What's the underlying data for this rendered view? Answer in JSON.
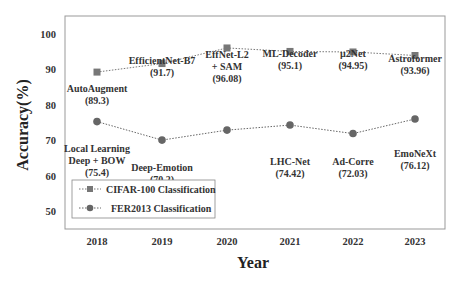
{
  "chart_data": {
    "type": "line",
    "title": "",
    "xlabel": "Year",
    "ylabel": "Accuracy(%)",
    "x": [
      "2018",
      "2019",
      "2020",
      "2021",
      "2022",
      "2023"
    ],
    "ylim": [
      45,
      105
    ],
    "yticks": [
      50,
      60,
      70,
      80,
      90,
      100
    ],
    "grid": false,
    "legend_position": "lower left (inside)",
    "series": [
      {
        "name": "CIFAR-100 Classification",
        "marker": "square",
        "color": "#777777",
        "linestyle": "dotted",
        "values": [
          89.3,
          91.7,
          96.08,
          95.1,
          94.95,
          93.96
        ],
        "labels": [
          "AutoAugment",
          "EfficientNet-B7",
          "EffNet-L2 + SAM",
          "ML-Decoder",
          "µ2Net",
          "Astroformer"
        ]
      },
      {
        "name": "FER2013 Classification",
        "marker": "circle",
        "color": "#666666",
        "linestyle": "dotted",
        "values": [
          75.4,
          70.2,
          null,
          74.42,
          72.03,
          76.12
        ],
        "labels": [
          "Local Learning Deep + BOW",
          "Deep-Emotion",
          "",
          "LHC-Net",
          "Ad-Corre",
          "EmoNeXt"
        ]
      }
    ]
  },
  "annotations": {
    "cifar": [
      {
        "lines": [
          "AutoAugment",
          "(89.3)"
        ]
      },
      {
        "lines": [
          "EfficientNet-B7",
          "(91.7)"
        ]
      },
      {
        "lines": [
          "EffNet-L2",
          "+ SAM",
          "(96.08)"
        ]
      },
      {
        "lines": [
          "ML-Decoder",
          "(95.1)"
        ]
      },
      {
        "lines": [
          "µ2Net",
          "(94.95)"
        ]
      },
      {
        "lines": [
          "Astroformer",
          "(93.96)"
        ]
      }
    ],
    "fer": [
      {
        "lines": [
          "Local Learning",
          "Deep + BOW",
          "(75.4)"
        ]
      },
      {
        "lines": [
          "Deep-Emotion",
          "(70.2)"
        ]
      },
      {
        "lines": [
          "LHC-Net",
          "(74.42)"
        ]
      },
      {
        "lines": [
          "Ad-Corre",
          "(72.03)"
        ]
      },
      {
        "lines": [
          "EmoNeXt",
          "(76.12)"
        ]
      }
    ]
  },
  "legend": {
    "items": [
      {
        "label": "CIFAR-100 Classification",
        "marker": "square"
      },
      {
        "label": "FER2013 Classification",
        "marker": "circle"
      }
    ]
  }
}
